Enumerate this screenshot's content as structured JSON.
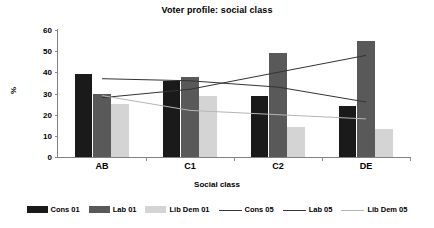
{
  "chart_data": {
    "type": "bar",
    "title": "Voter profile: social class",
    "xlabel": "Social class",
    "ylabel": "%",
    "categories": [
      "AB",
      "C1",
      "C2",
      "DE"
    ],
    "ylim": [
      0,
      60
    ],
    "yticks": [
      0,
      10,
      20,
      30,
      40,
      50,
      60
    ],
    "grid": false,
    "legend_position": "bottom",
    "series": [
      {
        "name": "Cons 01",
        "type": "bar",
        "color": "#1a1a1a",
        "values": [
          39,
          36,
          29,
          24
        ]
      },
      {
        "name": "Lab 01",
        "type": "bar",
        "color": "#595959",
        "values": [
          30,
          38,
          49,
          55
        ]
      },
      {
        "name": "Lib Dem 01",
        "type": "bar",
        "color": "#d4d4d4",
        "values": [
          25,
          29,
          14,
          13
        ]
      },
      {
        "name": "Cons 05",
        "type": "line",
        "color": "#333333",
        "values": [
          28,
          32,
          40,
          48
        ]
      },
      {
        "name": "Lab 05",
        "type": "line",
        "color": "#333333",
        "values": [
          37,
          36,
          33,
          26
        ]
      },
      {
        "name": "Lib Dem 05",
        "type": "line",
        "color": "#b5b5b5",
        "values": [
          29,
          22,
          20,
          18
        ]
      }
    ]
  },
  "legend": {
    "items": [
      {
        "label": "Cons 01",
        "kind": "bar",
        "swatch": "cons"
      },
      {
        "label": "Lab 01",
        "kind": "bar",
        "swatch": "lab"
      },
      {
        "label": "Lib Dem 01",
        "kind": "bar",
        "swatch": "libdem"
      },
      {
        "label": "Cons 05",
        "kind": "line",
        "swatch": "dark"
      },
      {
        "label": "Lab 05",
        "kind": "line",
        "swatch": "dark"
      },
      {
        "label": "Lib Dem 05",
        "kind": "line",
        "swatch": "light"
      }
    ]
  }
}
